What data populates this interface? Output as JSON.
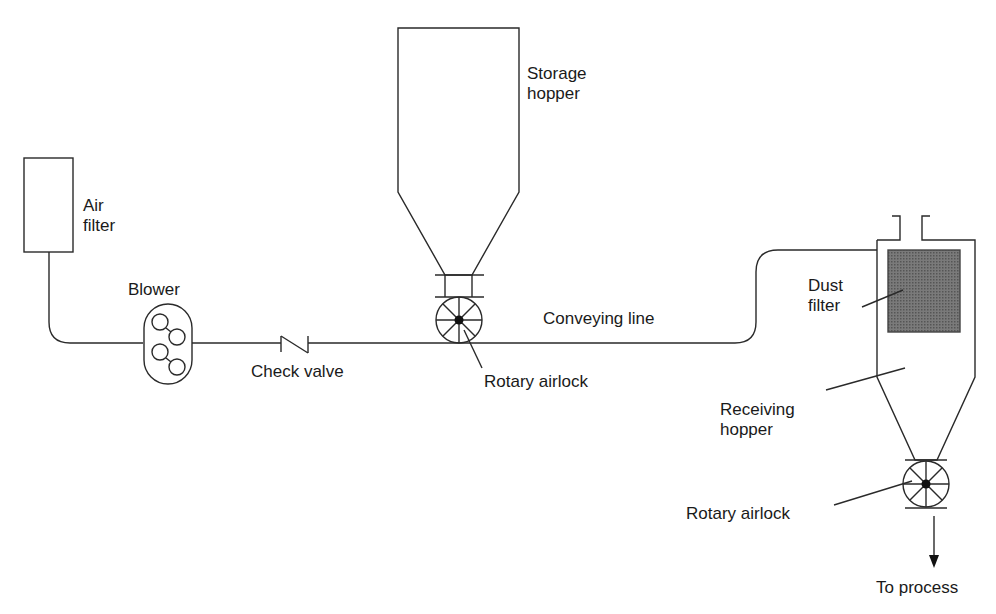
{
  "diagram": {
    "type": "pneumatic conveying system (positive pressure)",
    "components": {
      "air_filter": {
        "line1": "Air",
        "line2": "filter"
      },
      "blower": {
        "label": "Blower"
      },
      "check_valve": {
        "label": "Check valve"
      },
      "storage_hopper": {
        "line1": "Storage",
        "line2": "hopper"
      },
      "rotary_airlock_feed": {
        "label": "Rotary airlock"
      },
      "conveying_line": {
        "label": "Conveying line"
      },
      "dust_filter": {
        "line1": "Dust",
        "line2": "filter"
      },
      "receiving_hopper": {
        "line1": "Receiving",
        "line2": "hopper"
      },
      "rotary_airlock_discharge": {
        "label": "Rotary airlock"
      },
      "outlet": {
        "label": "To process"
      }
    },
    "flow": [
      "Air filter",
      "Blower",
      "Check valve",
      "Rotary airlock",
      "Conveying line",
      "Receiving hopper",
      "Rotary airlock",
      "To process"
    ],
    "colors": {
      "line": "#2a2a2a",
      "filter_fill": "#6e6e6e",
      "background": "#ffffff"
    }
  }
}
